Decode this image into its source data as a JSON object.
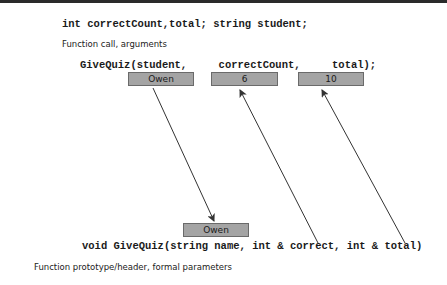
{
  "declaration": "int correctCount,total; string student;",
  "call_caption": "Function call, arguments",
  "call_line": {
    "text": "GiveQuiz(student,     correctCount,     total);",
    "args": [
      {
        "name": "student",
        "value": "Owen"
      },
      {
        "name": "correctCount",
        "value": "6"
      },
      {
        "name": "total",
        "value": "10"
      }
    ]
  },
  "param_box": {
    "value": "Owen"
  },
  "prototype_line": "void GiveQuiz(string name, int & correct, int & total)",
  "prototype_caption": "Function prototype/header, formal parameters",
  "colors": {
    "box_fill": "#a4a4a4",
    "box_border": "#6a6a6a",
    "arrow": "#333333",
    "topbar": "#2a2a2a"
  },
  "arrows": [
    {
      "from": "argument-student (Owen)",
      "to": "parameter name (Owen)",
      "direction": "down",
      "meaning": "pass by value copy"
    },
    {
      "from": "parameter correct",
      "to": "argument correctCount (6)",
      "direction": "up",
      "meaning": "reference"
    },
    {
      "from": "parameter total",
      "to": "argument total (10)",
      "direction": "up",
      "meaning": "reference"
    }
  ]
}
